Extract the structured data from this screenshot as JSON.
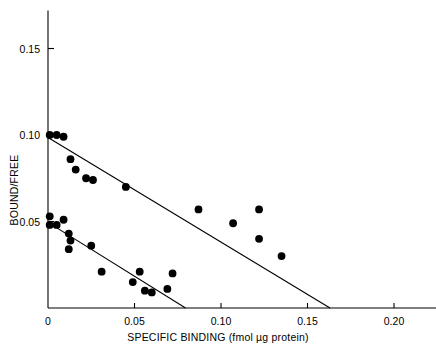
{
  "chart_data": {
    "type": "scatter",
    "title": "",
    "xlabel": "SPECIFIC BINDING (fmol µg protein)",
    "ylabel": "BOUND/FREE",
    "xlim": [
      0,
      0.225
    ],
    "ylim": [
      0,
      0.172
    ],
    "grid": false,
    "legend": null,
    "xticks": [
      0,
      0.05,
      0.1,
      0.15,
      0.2
    ],
    "xtick_labels": [
      "0",
      "0.05",
      "0.10",
      "0.15",
      "0.20"
    ],
    "yticks": [
      0.05,
      0.1,
      0.15
    ],
    "ytick_labels": [
      "0.05",
      "0.10",
      "0.15"
    ],
    "series": [
      {
        "name": "upper-site",
        "marker": "filled-circle",
        "marker_color": "#000000",
        "points": [
          [
            0.001,
            0.1
          ],
          [
            0.005,
            0.1
          ],
          [
            0.009,
            0.099
          ],
          [
            0.013,
            0.086
          ],
          [
            0.016,
            0.08
          ],
          [
            0.022,
            0.075
          ],
          [
            0.026,
            0.074
          ],
          [
            0.045,
            0.07
          ],
          [
            0.087,
            0.057
          ],
          [
            0.107,
            0.049
          ],
          [
            0.122,
            0.057
          ],
          [
            0.122,
            0.04
          ],
          [
            0.135,
            0.03
          ]
        ]
      },
      {
        "name": "lower-site",
        "marker": "filled-circle",
        "marker_color": "#000000",
        "points": [
          [
            0.001,
            0.053
          ],
          [
            0.001,
            0.048
          ],
          [
            0.005,
            0.048
          ],
          [
            0.009,
            0.051
          ],
          [
            0.012,
            0.043
          ],
          [
            0.013,
            0.039
          ],
          [
            0.012,
            0.034
          ],
          [
            0.025,
            0.036
          ],
          [
            0.031,
            0.021
          ],
          [
            0.053,
            0.021
          ],
          [
            0.072,
            0.02
          ],
          [
            0.049,
            0.015
          ],
          [
            0.056,
            0.01
          ],
          [
            0.06,
            0.009
          ],
          [
            0.069,
            0.011
          ]
        ]
      }
    ],
    "fit_lines": [
      {
        "name": "upper-regression",
        "x0": 0.0,
        "y0": 0.0985,
        "x1": 0.163,
        "y1": 0.0,
        "x_intercept": 0.163,
        "y_intercept": 0.0985
      },
      {
        "name": "lower-regression",
        "x0": 0.0,
        "y0": 0.0495,
        "x1": 0.0795,
        "y1": 0.0,
        "x_intercept": 0.0795,
        "y_intercept": 0.0495
      }
    ]
  }
}
